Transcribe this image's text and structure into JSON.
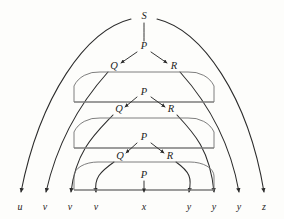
{
  "figure": {
    "background_color": "#fdfdfb",
    "line_color": "#2b2b2b",
    "capsule_color": "#6f6f6f",
    "bar_color": "#7b7b7b"
  },
  "root": {
    "label": "S",
    "x": 144,
    "y": 17
  },
  "levels": [
    {
      "index": 1,
      "parent": {
        "label": "P",
        "x": 144,
        "y": 47
      },
      "left": {
        "label": "Q",
        "x": 114,
        "y": 67
      },
      "right": {
        "label": "R",
        "x": 174,
        "y": 67
      }
    },
    {
      "index": 2,
      "parent": {
        "label": "P",
        "x": 144,
        "y": 93
      },
      "left": {
        "label": "Q",
        "x": 119,
        "y": 110
      },
      "right": {
        "label": "R",
        "x": 171,
        "y": 110
      }
    },
    {
      "index": 3,
      "parent": {
        "label": "P",
        "x": 144,
        "y": 138
      },
      "left": {
        "label": "Q",
        "x": 120,
        "y": 157
      },
      "right": {
        "label": "R",
        "x": 170,
        "y": 157
      }
    },
    {
      "index": 4,
      "parent": {
        "label": "P",
        "x": 144,
        "y": 176
      },
      "left": null,
      "right": null
    }
  ],
  "leaves": [
    {
      "label": "u",
      "x": 20,
      "y": 208
    },
    {
      "label": "v",
      "x": 45,
      "y": 208
    },
    {
      "label": "v",
      "x": 70,
      "y": 208
    },
    {
      "label": "v",
      "x": 96,
      "y": 208
    },
    {
      "label": "x",
      "x": 144,
      "y": 208
    },
    {
      "label": "y",
      "x": 189,
      "y": 208
    },
    {
      "label": "y",
      "x": 214,
      "y": 208
    },
    {
      "label": "y",
      "x": 239,
      "y": 208
    },
    {
      "label": "z",
      "x": 264,
      "y": 208
    }
  ],
  "bars": [
    {
      "x1": 74,
      "x2": 214,
      "y": 102
    },
    {
      "x1": 74,
      "x2": 214,
      "y": 148
    },
    {
      "x1": 74,
      "x2": 214,
      "y": 190
    }
  ],
  "capsules": [
    {
      "left": 74,
      "right": 214,
      "top": 72,
      "bottom": 102
    },
    {
      "left": 74,
      "right": 214,
      "top": 118,
      "bottom": 148
    },
    {
      "left": 74,
      "right": 214,
      "top": 162,
      "bottom": 190
    }
  ],
  "arcs": {
    "outer_left_from_root": {
      "from": "S",
      "to": "u"
    },
    "outer_right_from_root": {
      "from": "S",
      "to": "z"
    },
    "level1_left": {
      "from": "Q",
      "to": "v"
    },
    "level1_right": {
      "from": "R",
      "to": "y"
    },
    "level2_left": {
      "from": "Q",
      "to": "v"
    },
    "level2_right": {
      "from": "R",
      "to": "y"
    },
    "level3_left": {
      "from": "Q",
      "to": "v"
    },
    "level3_right": {
      "from": "R",
      "to": "y"
    },
    "level4_center": {
      "from": "P",
      "to": "x"
    }
  }
}
